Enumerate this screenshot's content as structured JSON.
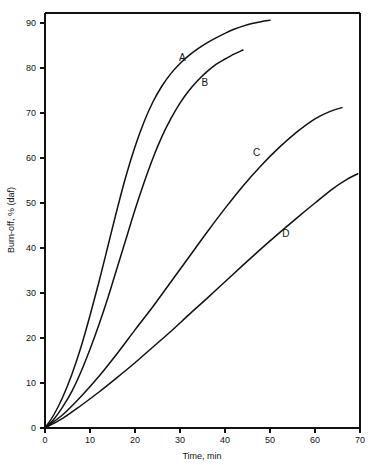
{
  "chart_data": {
    "type": "line",
    "title": "",
    "subtitle": "",
    "xlabel": "Time, min",
    "ylabel": "Burn-off, % (daf)",
    "xlim": [
      0,
      70
    ],
    "ylim": [
      0,
      92
    ],
    "xticks": [
      0,
      10,
      20,
      30,
      40,
      50,
      60,
      70
    ],
    "yticks": [
      0,
      10,
      20,
      30,
      40,
      50,
      60,
      70,
      80,
      90
    ],
    "xtick_labels": [
      "0",
      "10",
      "20",
      "30",
      "40",
      "50",
      "60",
      "70"
    ],
    "ytick_labels": [
      "0",
      "10",
      "20",
      "30",
      "40",
      "50",
      "60",
      "70",
      "80",
      "90"
    ],
    "grid": false,
    "legend": "inline-curve-labels",
    "line_color": "#111111",
    "background_color": "#ffffff",
    "frame": "box",
    "series": [
      {
        "name": "A",
        "label": "A",
        "label_x": 30.5,
        "label_y": 81.5,
        "x": [
          0,
          2,
          4,
          6,
          8,
          10,
          12,
          14,
          16,
          18,
          20,
          22,
          24,
          26,
          28,
          30,
          32,
          34,
          36,
          38,
          40,
          42,
          44,
          46,
          48,
          50
        ],
        "y": [
          0,
          3.0,
          7.0,
          12.0,
          18.0,
          25.0,
          32.5,
          40.5,
          48.5,
          56.0,
          62.5,
          68.0,
          72.5,
          76.0,
          78.8,
          81.0,
          82.8,
          84.3,
          85.6,
          86.7,
          87.7,
          88.6,
          89.3,
          89.9,
          90.3,
          90.6
        ]
      },
      {
        "name": "B",
        "label": "B",
        "label_x": 35.5,
        "label_y": 76.0,
        "x": [
          0,
          2,
          4,
          6,
          8,
          10,
          12,
          14,
          16,
          18,
          20,
          22,
          24,
          26,
          28,
          30,
          32,
          34,
          36,
          38,
          40,
          42,
          44
        ],
        "y": [
          0,
          2.0,
          4.8,
          8.2,
          12.5,
          17.5,
          23.0,
          29.0,
          35.5,
          42.0,
          48.5,
          54.5,
          60.0,
          64.8,
          68.8,
          72.2,
          75.0,
          77.3,
          79.2,
          80.8,
          82.0,
          83.1,
          84.0
        ]
      },
      {
        "name": "C",
        "label": "C",
        "label_x": 47.0,
        "label_y": 60.5,
        "x": [
          0,
          4,
          8,
          12,
          16,
          20,
          24,
          28,
          32,
          36,
          40,
          44,
          48,
          52,
          56,
          60,
          63,
          66
        ],
        "y": [
          0,
          3.0,
          7.0,
          11.5,
          16.5,
          21.8,
          27.0,
          32.5,
          38.0,
          43.5,
          48.8,
          53.8,
          58.3,
          62.3,
          65.8,
          68.7,
          70.2,
          71.2
        ]
      },
      {
        "name": "D",
        "label": "D",
        "label_x": 53.5,
        "label_y": 42.5,
        "x": [
          0,
          4,
          8,
          12,
          16,
          20,
          24,
          28,
          32,
          36,
          40,
          44,
          48,
          52,
          56,
          60,
          64,
          67,
          69.5
        ],
        "y": [
          0,
          2.2,
          5.0,
          8.0,
          11.2,
          14.5,
          18.0,
          21.5,
          25.2,
          28.8,
          32.5,
          36.2,
          39.8,
          43.3,
          46.7,
          50.0,
          53.2,
          55.2,
          56.5
        ]
      }
    ]
  }
}
